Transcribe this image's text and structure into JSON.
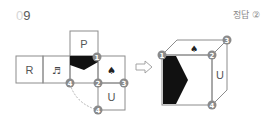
{
  "question": {
    "number_prefix": "0",
    "number_main": "9",
    "answer_label": "정답 ②"
  },
  "net": {
    "faces": [
      {
        "id": "top",
        "label": "P"
      },
      {
        "id": "left-most",
        "label": "R"
      },
      {
        "id": "music",
        "label": "♬"
      },
      {
        "id": "black",
        "label": ""
      },
      {
        "id": "spade",
        "label": "♠"
      },
      {
        "id": "bottom",
        "label": "U"
      }
    ],
    "markers": [
      {
        "id": "m1",
        "label": "1"
      },
      {
        "id": "m2",
        "label": "2"
      },
      {
        "id": "m3",
        "label": "3"
      },
      {
        "id": "m4a",
        "label": "4"
      },
      {
        "id": "m4b",
        "label": "4"
      }
    ]
  },
  "arrow": {
    "label": "⇨"
  },
  "cube": {
    "top_symbol": "♠",
    "right_label": "U",
    "markers": [
      {
        "id": "c1",
        "label": "1"
      },
      {
        "id": "c2",
        "label": "2"
      },
      {
        "id": "c3",
        "label": "3"
      },
      {
        "id": "c4",
        "label": "4"
      }
    ]
  },
  "colors": {
    "line": "#8c8c8c",
    "badge": "#8a8a8a",
    "fill_black": "#111111"
  }
}
